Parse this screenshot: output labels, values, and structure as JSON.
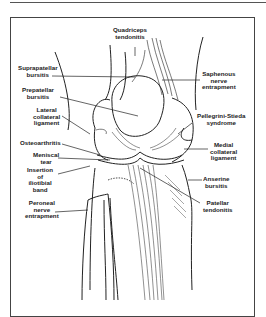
{
  "figure": {
    "labels": {
      "quadriceps_tendonitis": "Quadriceps\ntendonitis",
      "suprapatellar_bursitis": "Suprapatellar\nbursitis",
      "saphenous_nerve_entrapment": "Saphenous\nnerve\nentrapment",
      "prepatellar_bursitis": "Prepatellar\nbursitis",
      "lateral_collateral_ligament": "Lateral\ncollateral\nligament",
      "pellegrini_stieda_syndrome": "Pellegrini-Stieda\nsyndrome",
      "osteoarthritis": "Osteoarthritis",
      "medial_collateral_ligament": "Medial\ncollateral\nligament",
      "meniscal_tear": "Meniscal\ntear",
      "insertion_iliotibial_band": "Insertion\nof\niliotibial\nband",
      "anserine_bursitis": "Anserine\nbursitis",
      "peroneal_nerve_entrapment": "Peroneal\nnerve\nentrapment",
      "patellar_tendonitis": "Patellar\ntendonitis"
    },
    "colors": {
      "line": "#222222",
      "frame": "#444444",
      "background": "#ffffff"
    }
  }
}
